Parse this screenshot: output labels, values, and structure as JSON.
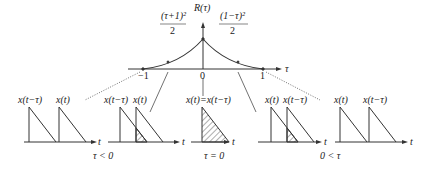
{
  "top_plot": {
    "ylabel": "R(τ)",
    "xlabel": "τ",
    "left_formula_num": "(τ+1)²",
    "left_formula_den": "2",
    "right_formula_num": "(1−τ)²",
    "right_formula_den": "2",
    "ticks": [
      "−1",
      "0",
      "1"
    ]
  },
  "panels": [
    {
      "labels": [
        "x(t−τ)",
        "x(t)"
      ],
      "axis": "t"
    },
    {
      "labels": [
        "x(t−τ)",
        "x(t)"
      ],
      "axis": "t"
    },
    {
      "labels": [
        "x(t)=x(t−τ)"
      ],
      "axis": "t"
    },
    {
      "labels": [
        "x(t)",
        "x(t−τ)"
      ],
      "axis": "t"
    },
    {
      "labels": [
        "x(t)",
        "x(t−τ)"
      ],
      "axis": "t"
    }
  ],
  "conditions": [
    "τ < 0",
    "τ = 0",
    "0 < τ"
  ]
}
